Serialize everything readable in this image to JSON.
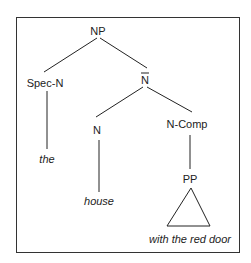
{
  "diagram": {
    "type": "syntax-tree",
    "nodes": {
      "root": "NP",
      "spec": "Spec-N",
      "nbar": "N",
      "head": "N",
      "comp": "N-Comp",
      "pp": "PP"
    },
    "leaves": {
      "spec_word": "the",
      "head_word": "house",
      "pp_phrase": "with the red door"
    },
    "colors": {
      "line": "#222222",
      "text": "#222222",
      "frame": "#333333"
    }
  }
}
